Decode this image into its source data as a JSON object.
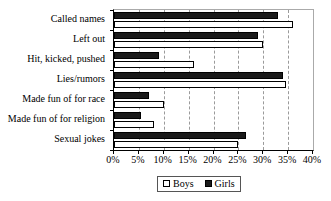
{
  "chart_data": {
    "type": "bar",
    "orientation": "horizontal",
    "title": "",
    "xlabel": "",
    "ylabel": "",
    "xlim": [
      0,
      40
    ],
    "xtick_labels": [
      "0%",
      "5%",
      "10%",
      "15%",
      "20%",
      "25%",
      "30%",
      "35%",
      "40%"
    ],
    "xtick_values": [
      0,
      5,
      10,
      15,
      20,
      25,
      30,
      35,
      40
    ],
    "grid": true,
    "grid_style": "dashed-vertical",
    "legend_position": "bottom-center",
    "categories": [
      "Called names",
      "Left out",
      "Hit, kicked, pushed",
      "Lies/rumors",
      "Made fun of for race",
      "Made fun of for religion",
      "Sexual jokes"
    ],
    "series": [
      {
        "name": "Boys",
        "color": "#ffffff",
        "values": [
          36.0,
          30.0,
          16.0,
          34.5,
          10.0,
          8.0,
          25.0
        ]
      },
      {
        "name": "Girls",
        "color": "#1a1a1a",
        "values": [
          33.0,
          29.0,
          9.0,
          34.0,
          7.0,
          5.5,
          26.5
        ]
      }
    ]
  },
  "legend": {
    "entries": [
      {
        "label": "Boys",
        "swatch": "open-square-swatch"
      },
      {
        "label": "Girls",
        "swatch": "filled-square-swatch"
      }
    ]
  }
}
